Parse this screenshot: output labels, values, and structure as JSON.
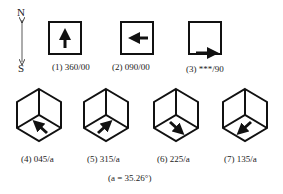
{
  "compass": {
    "north": "N",
    "south": "S"
  },
  "top_row": [
    {
      "label": "(1) 360/00",
      "arrow": "up"
    },
    {
      "label": "(2) 090/00",
      "arrow": "left"
    },
    {
      "label": "(3) ***/90",
      "arrow": "right-bottom-edge"
    }
  ],
  "bottom_row": [
    {
      "label": "(4) 045/a",
      "arrow": "up-left"
    },
    {
      "label": "(5) 315/a",
      "arrow": "up-right"
    },
    {
      "label": "(6) 225/a",
      "arrow": "down-right"
    },
    {
      "label": "(7) 135/a",
      "arrow": "down-left"
    }
  ],
  "footnote": "(a = 35.26°)",
  "colors": {
    "stroke": "#111111",
    "background": "#ffffff"
  }
}
